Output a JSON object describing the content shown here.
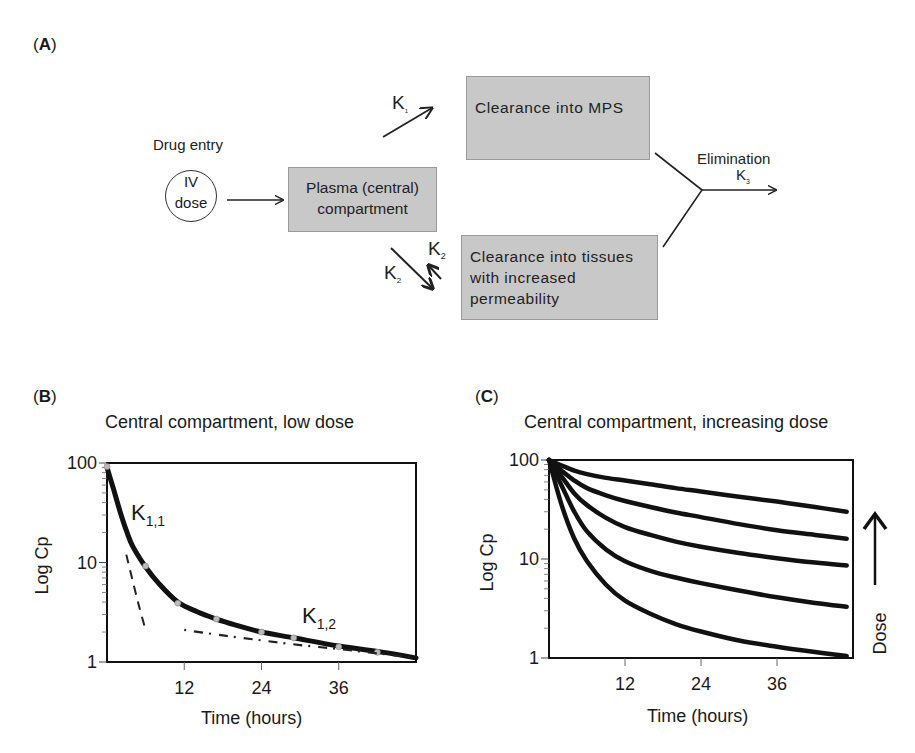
{
  "panels": {
    "A": {
      "label": "A"
    },
    "B": {
      "label": "B"
    },
    "C": {
      "label": "C"
    }
  },
  "diagram": {
    "drug_entry": "Drug entry",
    "iv_line1": "IV",
    "iv_line2": "dose",
    "plasma_line1": "Plasma (central)",
    "plasma_line2": "compartment",
    "mps_box": "Clearance into MPS",
    "tissue_line1": "Clearance into tissues",
    "tissue_line2": "with increased",
    "tissue_line3": "permeability",
    "elimination": "Elimination",
    "k1": {
      "base": "K",
      "sub": "1"
    },
    "k2_out": {
      "base": "K",
      "sub": "2"
    },
    "k2_back": {
      "base": "K",
      "sub": "2"
    },
    "k3": {
      "base": "K",
      "sub": "3"
    }
  },
  "chart_data": [
    {
      "type": "line",
      "panel": "B",
      "title": "Central compartment, low dose",
      "xlabel": "Time (hours)",
      "ylabel": "Log Cp",
      "yscale": "log",
      "xlim": [
        0,
        48
      ],
      "ylim": [
        1,
        100
      ],
      "xticks": [
        12,
        24,
        36
      ],
      "yticks": [
        1,
        10,
        100
      ],
      "annotations": [
        {
          "text": "K",
          "sub": "1,1",
          "near": "early steep phase"
        },
        {
          "text": "K",
          "sub": "1,2",
          "near": "late slow phase"
        }
      ],
      "series": [
        {
          "name": "observed (fit)",
          "style": "solid-thick",
          "x": [
            0,
            1,
            2,
            3,
            4,
            6,
            8,
            11,
            14,
            17,
            20,
            24,
            29,
            36,
            43,
            48
          ],
          "y": [
            90,
            55,
            33,
            21,
            14.5,
            9,
            6.2,
            4.0,
            3.2,
            2.7,
            2.35,
            2.0,
            1.75,
            1.45,
            1.25,
            1.1
          ]
        },
        {
          "name": "points",
          "style": "markers",
          "x": [
            0,
            6,
            11,
            17,
            24,
            29,
            36,
            42
          ],
          "y": [
            92,
            9.2,
            3.9,
            2.7,
            2.0,
            1.75,
            1.42,
            1.25
          ]
        },
        {
          "name": "alpha phase extrapolation",
          "style": "dashed",
          "x": [
            3,
            4,
            5,
            6
          ],
          "y": [
            12,
            6.5,
            3.6,
            2.1
          ]
        },
        {
          "name": "beta phase extrapolation",
          "style": "dash-dot",
          "x": [
            12,
            18,
            24,
            30,
            36,
            42,
            48
          ],
          "y": [
            2.1,
            1.85,
            1.65,
            1.48,
            1.35,
            1.22,
            1.1
          ]
        }
      ]
    },
    {
      "type": "line",
      "panel": "C",
      "title": "Central compartment, increasing dose",
      "xlabel": "Time (hours)",
      "ylabel": "Log Cp",
      "yscale": "log",
      "xlim": [
        0,
        48
      ],
      "ylim": [
        1,
        100
      ],
      "xticks": [
        12,
        24,
        36
      ],
      "yticks": [
        1,
        10,
        100
      ],
      "arrow_label": "Dose",
      "arrow_direction": "up",
      "series": [
        {
          "name": "dose 1 (lowest)",
          "x": [
            0,
            2,
            4,
            6,
            9,
            12,
            16,
            20,
            24,
            30,
            36,
            42,
            47
          ],
          "y": [
            100,
            35,
            16,
            9.5,
            5.5,
            3.8,
            2.8,
            2.2,
            1.85,
            1.5,
            1.3,
            1.15,
            1.05
          ]
        },
        {
          "name": "dose 2",
          "x": [
            0,
            2,
            4,
            6,
            9,
            12,
            16,
            20,
            24,
            30,
            36,
            42,
            47
          ],
          "y": [
            100,
            55,
            30,
            19,
            12.5,
            9.5,
            7.6,
            6.5,
            5.7,
            4.8,
            4.1,
            3.6,
            3.3
          ]
        },
        {
          "name": "dose 3",
          "x": [
            0,
            2,
            4,
            6,
            9,
            12,
            16,
            20,
            24,
            30,
            36,
            42,
            47
          ],
          "y": [
            100,
            68,
            46,
            35,
            26,
            21,
            17.5,
            15,
            13.3,
            11.5,
            10.2,
            9.2,
            8.6
          ]
        },
        {
          "name": "dose 4",
          "x": [
            0,
            2,
            4,
            6,
            9,
            12,
            16,
            20,
            24,
            30,
            36,
            42,
            47
          ],
          "y": [
            100,
            78,
            62,
            52,
            44,
            38.5,
            33.5,
            29.5,
            26.5,
            22.5,
            19.5,
            17.5,
            16
          ]
        },
        {
          "name": "dose 5 (highest)",
          "x": [
            0,
            2,
            4,
            6,
            9,
            12,
            16,
            20,
            24,
            30,
            36,
            42,
            47
          ],
          "y": [
            100,
            88,
            78,
            72,
            66,
            62,
            57,
            52,
            48,
            42.5,
            38,
            33.5,
            30
          ]
        }
      ]
    }
  ]
}
